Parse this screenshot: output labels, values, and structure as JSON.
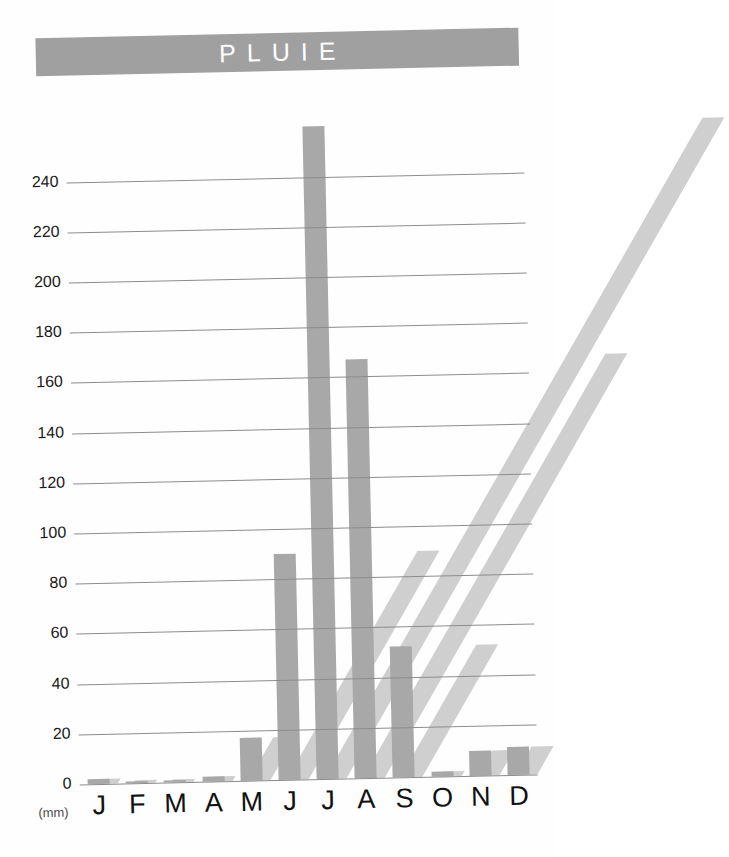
{
  "title": {
    "text": "PLUIE"
  },
  "axis": {
    "unit_label": "(mm)",
    "y_ticks": [
      "240",
      "220",
      "200",
      "180",
      "160",
      "140",
      "120",
      "100",
      "80",
      "60",
      "40",
      "20",
      "0"
    ],
    "x_labels": [
      "J",
      "F",
      "M",
      "A",
      "M",
      "J",
      "J",
      "A",
      "S",
      "O",
      "N",
      "D"
    ]
  },
  "colors": {
    "banner": "#a0a0a0",
    "banner_text": "#ffffff",
    "bar": "#a8a8a8",
    "bar_shadow": "#cfcfcf",
    "gridline": "#8c8c8c",
    "background": "#ffffff"
  },
  "chart_data": {
    "type": "bar",
    "title": "PLUIE",
    "xlabel": "",
    "ylabel": "(mm)",
    "categories": [
      "J",
      "F",
      "M",
      "A",
      "M",
      "J",
      "J",
      "A",
      "S",
      "O",
      "N",
      "D"
    ],
    "category_names": [
      "Janvier",
      "Fevrier",
      "Mars",
      "Avril",
      "Mai",
      "Juin",
      "Juillet",
      "Aout",
      "Septembre",
      "Octobre",
      "Novembre",
      "Decembre"
    ],
    "values": [
      2,
      1,
      1,
      2,
      17,
      90,
      260,
      167,
      52,
      2,
      10,
      11
    ],
    "ylim": [
      0,
      260
    ],
    "ytick_step": 20,
    "grid": true,
    "legend": "none"
  }
}
